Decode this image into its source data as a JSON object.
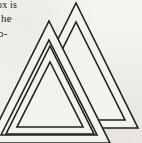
{
  "page": {
    "background_color": "#f4f2ed",
    "ink_color": "#221f1d",
    "width": 142,
    "height": 143
  },
  "text_column": {
    "lines": [
      {
        "id": "line-1",
        "text": "ox is"
      },
      {
        "id": "line-2",
        "text": "he"
      },
      {
        "id": "line-3",
        "text": "o-"
      }
    ]
  },
  "figure": {
    "name": "valknut",
    "caption": "",
    "stroke_color": "#221f1d",
    "fill_color": "#f4f2ed",
    "stroke_width": 1.6,
    "triangle_count": 3
  }
}
